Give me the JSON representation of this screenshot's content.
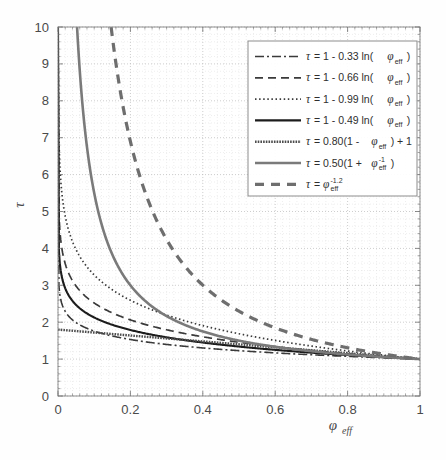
{
  "chart_data": {
    "type": "line",
    "title": "",
    "xlabel": "φ_eff",
    "ylabel": "τ",
    "xlim": [
      0,
      1
    ],
    "ylim": [
      0,
      10
    ],
    "grid": true,
    "grid_style": "dotted",
    "legend_position": "upper-right",
    "xticks": [
      "0",
      "0.2",
      "0.4",
      "0.6",
      "0.8",
      "1"
    ],
    "xtick_values": [
      0,
      0.2,
      0.4,
      0.6,
      0.8,
      1
    ],
    "yticks": [
      "0",
      "1",
      "2",
      "3",
      "4",
      "5",
      "6",
      "7",
      "8",
      "9",
      "10"
    ],
    "ytick_values": [
      0,
      1,
      2,
      3,
      4,
      5,
      6,
      7,
      8,
      9,
      10
    ],
    "series": [
      {
        "name": "tau = 1 - 0.33 ln(phi_eff)",
        "legend_parts": {
          "tau": "τ",
          "eq": "=",
          "body": "1 - 0.33 ln(",
          "phi": "φ",
          "sub": "eff",
          "close": ")"
        },
        "coefficient": 0.33,
        "form": "1 - c*ln(x)",
        "style": "dashdot",
        "color": "#3a3a3a",
        "width": 1.6,
        "dasharray": "9,3,2,3",
        "x": [
          0.01,
          0.02,
          0.03,
          0.05,
          0.08,
          0.1,
          0.15,
          0.2,
          0.25,
          0.3,
          0.35,
          0.4,
          0.45,
          0.5,
          0.55,
          0.6,
          0.65,
          0.7,
          0.75,
          0.8,
          0.85,
          0.9,
          0.95,
          1.0
        ],
        "y": [
          2.52,
          2.29,
          2.16,
          1.99,
          1.83,
          1.76,
          1.63,
          1.53,
          1.46,
          1.4,
          1.35,
          1.3,
          1.26,
          1.23,
          1.2,
          1.17,
          1.14,
          1.12,
          1.09,
          1.07,
          1.05,
          1.03,
          1.02,
          1.0
        ]
      },
      {
        "name": "tau = 1 - 0.66 ln(phi_eff)",
        "legend_parts": {
          "tau": "τ",
          "eq": "=",
          "body": "1 - 0.66 ln(",
          "phi": "φ",
          "sub": "eff",
          "close": ")"
        },
        "coefficient": 0.66,
        "form": "1 - c*ln(x)",
        "style": "dashed",
        "color": "#3a3a3a",
        "width": 1.7,
        "dasharray": "8,5",
        "x": [
          0.005,
          0.01,
          0.02,
          0.03,
          0.05,
          0.08,
          0.1,
          0.15,
          0.2,
          0.25,
          0.3,
          0.35,
          0.4,
          0.45,
          0.5,
          0.55,
          0.6,
          0.65,
          0.7,
          0.75,
          0.8,
          0.85,
          0.9,
          0.95,
          1.0
        ],
        "y": [
          4.5,
          4.04,
          3.58,
          3.31,
          2.98,
          2.67,
          2.52,
          2.25,
          2.06,
          1.92,
          1.79,
          1.69,
          1.6,
          1.53,
          1.46,
          1.39,
          1.34,
          1.28,
          1.24,
          1.19,
          1.15,
          1.11,
          1.07,
          1.03,
          1.0
        ]
      },
      {
        "name": "tau = 1 - 0.99 ln(phi_eff)",
        "legend_parts": {
          "tau": "τ",
          "eq": "=",
          "body": "1 - 0.99 ln(",
          "phi": "φ",
          "sub": "eff",
          "close": ")"
        },
        "coefficient": 0.99,
        "form": "1 - c*ln(x)",
        "style": "dotted",
        "color": "#3a3a3a",
        "width": 1.7,
        "dasharray": "1.5,2.6",
        "x": [
          0.004,
          0.006,
          0.01,
          0.02,
          0.03,
          0.05,
          0.08,
          0.1,
          0.15,
          0.2,
          0.25,
          0.3,
          0.35,
          0.4,
          0.45,
          0.5,
          0.55,
          0.6,
          0.65,
          0.7,
          0.75,
          0.8,
          0.85,
          0.9,
          0.95,
          1.0
        ],
        "y": [
          6.46,
          5.06,
          5.56,
          4.87,
          4.47,
          3.97,
          3.5,
          3.28,
          2.88,
          2.59,
          2.37,
          2.19,
          2.04,
          1.91,
          1.79,
          1.69,
          1.59,
          1.51,
          1.43,
          1.35,
          1.28,
          1.22,
          1.16,
          1.1,
          1.05,
          1.0
        ]
      },
      {
        "name": "tau = 1 - 0.49 ln(phi_eff)",
        "legend_parts": {
          "tau": "τ",
          "eq": "=",
          "body": "1 - 0.49 ln(",
          "phi": "φ",
          "sub": "eff",
          "close": ")"
        },
        "coefficient": 0.49,
        "form": "1 - c*ln(x)",
        "style": "solid",
        "color": "#1c1c1c",
        "width": 2.1,
        "dasharray": "",
        "x": [
          0.004,
          0.008,
          0.012,
          0.02,
          0.03,
          0.05,
          0.08,
          0.1,
          0.15,
          0.2,
          0.25,
          0.3,
          0.35,
          0.4,
          0.45,
          0.5,
          0.55,
          0.6,
          0.65,
          0.7,
          0.75,
          0.8,
          0.85,
          0.9,
          0.95,
          1.0
        ],
        "y": [
          3.7,
          3.36,
          3.16,
          2.92,
          2.72,
          2.47,
          2.24,
          2.13,
          1.93,
          1.79,
          1.68,
          1.59,
          1.51,
          1.45,
          1.39,
          1.34,
          1.29,
          1.25,
          1.21,
          1.17,
          1.14,
          1.11,
          1.08,
          1.05,
          1.03,
          1.0
        ]
      },
      {
        "name": "tau = 0.80(1 - phi_eff) + 1",
        "legend_parts": {
          "tau": "τ",
          "eq": "=",
          "body": "0.80(1 - ",
          "phi": "φ",
          "sub": "eff",
          "close": ") + 1"
        },
        "coefficient": 0.8,
        "form": "0.80*(1-x)+1",
        "style": "solid-textured",
        "color": "#555555",
        "width": 2.4,
        "dasharray": "",
        "x": [
          0,
          0.1,
          0.2,
          0.3,
          0.4,
          0.5,
          0.6,
          0.7,
          0.8,
          0.9,
          1.0
        ],
        "y": [
          1.8,
          1.72,
          1.64,
          1.56,
          1.48,
          1.4,
          1.32,
          1.24,
          1.16,
          1.08,
          1.0
        ]
      },
      {
        "name": "tau = 0.50(1 + phi_eff^-1)",
        "legend_parts": {
          "tau": "τ",
          "eq": "=",
          "body": "0.50(1 + ",
          "phi": "φ",
          "sub": "eff",
          "sup": "-1",
          "close": ")"
        },
        "coefficient": 0.5,
        "form": "0.50*(1+1/x)",
        "style": "solid-gray",
        "color": "#7a7a7a",
        "width": 2.6,
        "dasharray": "",
        "x": [
          0.053,
          0.06,
          0.07,
          0.08,
          0.09,
          0.1,
          0.12,
          0.15,
          0.2,
          0.25,
          0.3,
          0.35,
          0.4,
          0.45,
          0.5,
          0.55,
          0.6,
          0.65,
          0.7,
          0.75,
          0.8,
          0.85,
          0.9,
          0.95,
          1.0
        ],
        "y": [
          10.0,
          8.83,
          7.64,
          6.75,
          6.06,
          5.5,
          4.67,
          3.83,
          3.0,
          2.5,
          2.17,
          1.93,
          1.75,
          1.61,
          1.5,
          1.41,
          1.33,
          1.27,
          1.21,
          1.17,
          1.13,
          1.09,
          1.06,
          1.03,
          1.0
        ]
      },
      {
        "name": "tau = phi_eff^-1.2",
        "legend_parts": {
          "tau": "τ",
          "eq": "=",
          "body": "",
          "phi": "φ",
          "sub": "eff",
          "sup": "-1.2",
          "close": ""
        },
        "exponent": -1.2,
        "form": "x^-1.2",
        "style": "dashed-thick",
        "color": "#6e6e6e",
        "width": 3.2,
        "dasharray": "9,7",
        "x": [
          0.147,
          0.16,
          0.18,
          0.2,
          0.22,
          0.25,
          0.3,
          0.35,
          0.4,
          0.45,
          0.5,
          0.55,
          0.6,
          0.65,
          0.7,
          0.75,
          0.8,
          0.85,
          0.9,
          0.95,
          1.0
        ],
        "y": [
          10.0,
          9.01,
          7.82,
          6.9,
          6.16,
          5.28,
          4.17,
          3.44,
          2.92,
          2.53,
          2.23,
          1.99,
          1.8,
          1.64,
          1.5,
          1.39,
          1.29,
          1.21,
          1.13,
          1.06,
          1.0
        ]
      }
    ]
  },
  "axes": {
    "x_label_base": "φ",
    "x_label_sub": "eff",
    "y_label": "τ"
  }
}
